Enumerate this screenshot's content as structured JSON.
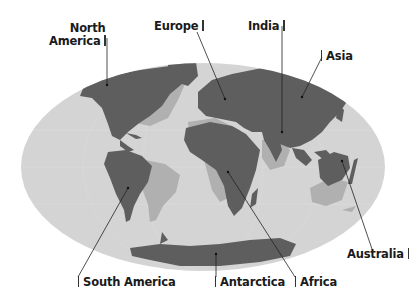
{
  "figure": {
    "type": "world-map-diagram",
    "projection": "elliptical (Mollweide-like)",
    "colors": {
      "ocean": "#d4d4d4",
      "continent_current": "#5e5e5e",
      "continent_shifted": "#b0b0b0",
      "leader_line": "#222222",
      "label_text": "#1a1a1a",
      "background": "#ffffff"
    }
  },
  "labels": {
    "north_america_line1": "North",
    "north_america_line2": "America",
    "europe": "Europe",
    "india": "India",
    "asia": "Asia",
    "australia": "Australia",
    "south_america": "South America",
    "antarctica": "Antarctica",
    "africa": "Africa"
  }
}
